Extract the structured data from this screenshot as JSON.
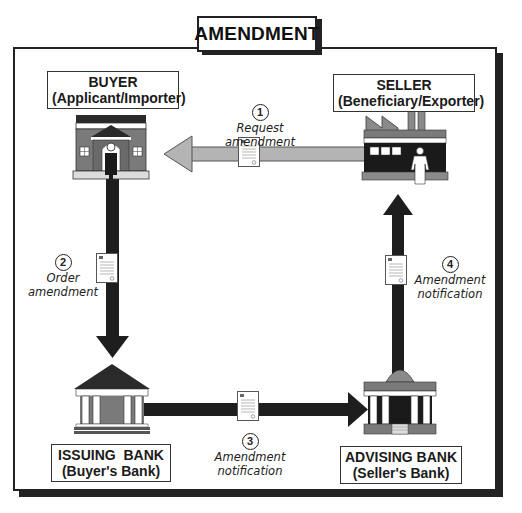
{
  "title": "AMENDMENT",
  "parties": {
    "buyer": {
      "name": "BUYER",
      "role": "(Applicant/Importer)"
    },
    "seller": {
      "name": "SELLER",
      "role": "(Beneficiary/Exporter)"
    },
    "issuing_bank": {
      "name": "ISSUING  BANK",
      "role": "(Buyer's Bank)"
    },
    "advising_bank": {
      "name": "ADVISING BANK",
      "role": "(Seller's Bank)"
    }
  },
  "steps": [
    {
      "number": "1",
      "label": "Request amendment",
      "from": "Seller",
      "to": "Buyer"
    },
    {
      "number": "2",
      "label_line1": "Order",
      "label_line2": "amendment",
      "from": "Buyer",
      "to": "Issuing Bank"
    },
    {
      "number": "3",
      "label_line1": "Amendment",
      "label_line2": "notification",
      "from": "Issuing Bank",
      "to": "Advising Bank"
    },
    {
      "number": "4",
      "label_line1": "Amendment",
      "label_line2": "notification",
      "from": "Advising Bank",
      "to": "Seller"
    }
  ],
  "colors": {
    "frame": "#222222",
    "arrow_dark": "#1e1e1e",
    "arrow_light": "#b4b4b4",
    "building_gray": "#7a7a7a",
    "roof_dark": "#2a2a2a"
  }
}
